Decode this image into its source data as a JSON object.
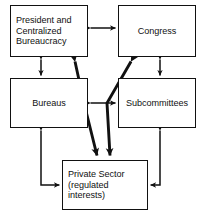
{
  "diagram": {
    "type": "block-flow",
    "line_color": "#111111",
    "background_color": "#ffffff",
    "nodes": [
      {
        "id": "president",
        "label": "President and\nCentralized\nBureaucracy",
        "align": "left"
      },
      {
        "id": "congress",
        "label": "Congress",
        "align": "center"
      },
      {
        "id": "bureaus",
        "label": "Bureaus",
        "align": "center"
      },
      {
        "id": "subcommittees",
        "label": "Subcommittees",
        "align": "center"
      },
      {
        "id": "private",
        "label": "Private Sector\n(regulated\ninterests)",
        "align": "left"
      }
    ],
    "connectors": [
      {
        "id": "president-congress",
        "from": "president",
        "to": "congress",
        "style": "thin",
        "arrows": "both",
        "path": "horizontal"
      },
      {
        "id": "president-bureaus",
        "from": "president",
        "to": "bureaus",
        "style": "thin",
        "arrows": "both",
        "path": "vertical"
      },
      {
        "id": "congress-subcommittees",
        "from": "congress",
        "to": "subcommittees",
        "style": "thin",
        "arrows": "both",
        "path": "vertical"
      },
      {
        "id": "bureaus-subcommittees",
        "from": "bureaus",
        "to": "subcommittees",
        "style": "thin",
        "arrows": "both",
        "path": "horizontal"
      },
      {
        "id": "bureaus-private",
        "from": "bureaus",
        "to": "private",
        "style": "thin",
        "arrows": "both",
        "path": "elbow-left"
      },
      {
        "id": "subcommittees-private",
        "from": "subcommittees",
        "to": "private",
        "style": "thin",
        "arrows": "both",
        "path": "elbow-right"
      },
      {
        "id": "president-private",
        "from": "president",
        "to": "private",
        "style": "thick",
        "arrows": "both",
        "path": "diagonal"
      },
      {
        "id": "congress-private",
        "from": "congress",
        "to": "private",
        "style": "thick",
        "arrows": "both",
        "path": "diagonal"
      }
    ]
  }
}
